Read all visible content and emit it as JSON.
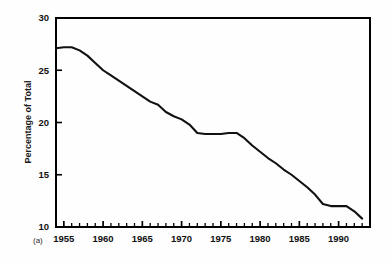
{
  "figure": {
    "panel_label": "(a)",
    "background_color": "#fefefe",
    "frame_color": "#000000",
    "line_color": "#111111"
  },
  "chart_data": {
    "type": "line",
    "title": "",
    "subtitle": "",
    "xlabel": "",
    "ylabel": "Percentage of Total",
    "xlim": [
      1954,
      1994
    ],
    "ylim": [
      10,
      30
    ],
    "grid": false,
    "legend": null,
    "legend_position": "none",
    "y_ticks": [
      10,
      15,
      20,
      25,
      30
    ],
    "y_tick_labels": [
      "10",
      "15",
      "20",
      "25",
      "30"
    ],
    "x_ticks": [
      1955,
      1960,
      1965,
      1970,
      1975,
      1980,
      1985,
      1990
    ],
    "x_tick_labels": [
      "1955",
      "1960",
      "1965",
      "1970",
      "1975",
      "1980",
      "1985",
      "1990"
    ],
    "x_minor_tick_interval": 1,
    "annotations": [
      "(a)"
    ],
    "series": [
      {
        "name": "Percentage of Total",
        "x": [
          1954,
          1955,
          1956,
          1957,
          1958,
          1959,
          1960,
          1961,
          1962,
          1963,
          1964,
          1965,
          1966,
          1967,
          1968,
          1969,
          1970,
          1971,
          1972,
          1973,
          1974,
          1975,
          1976,
          1977,
          1978,
          1979,
          1980,
          1981,
          1982,
          1983,
          1984,
          1985,
          1986,
          1987,
          1988,
          1989,
          1990,
          1991,
          1992,
          1993
        ],
        "values": [
          27.1,
          27.2,
          27.2,
          26.9,
          26.4,
          25.7,
          25.0,
          24.5,
          24.0,
          23.5,
          23.0,
          22.5,
          22.0,
          21.7,
          21.0,
          20.6,
          20.3,
          19.8,
          19.0,
          18.9,
          18.9,
          18.9,
          19.0,
          19.0,
          18.5,
          17.8,
          17.2,
          16.6,
          16.1,
          15.5,
          15.0,
          14.4,
          13.8,
          13.1,
          12.2,
          12.0,
          12.0,
          12.0,
          11.5,
          10.8
        ]
      }
    ]
  }
}
